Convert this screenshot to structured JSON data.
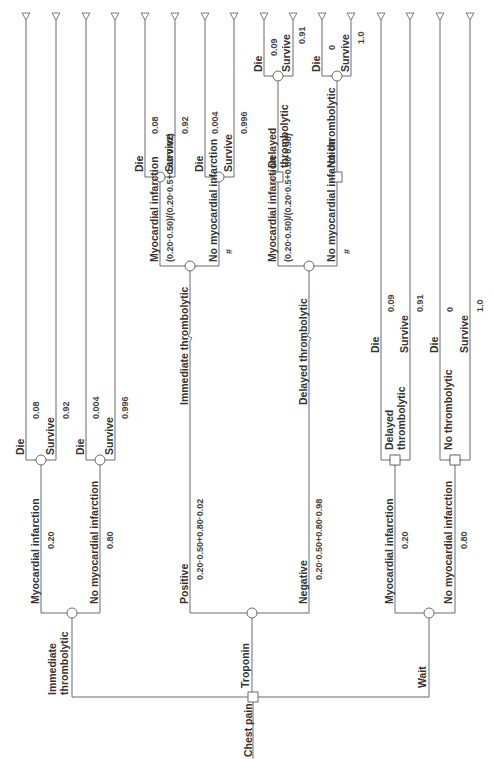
{
  "diagram": {
    "type": "decision-tree",
    "orientation": "rotated-90-ccw",
    "root": {
      "label": "Chest pain",
      "node": "decision"
    },
    "strategies": [
      {
        "id": "immediate",
        "label_line1": "Immediate",
        "label_line2": "thrombolytic",
        "branches": [
          {
            "label": "Myocardial infarction",
            "prob": "0.20",
            "outcomes": [
              {
                "label": "Die",
                "prob": "0.08"
              },
              {
                "label": "Survive",
                "prob": "0.92"
              }
            ]
          },
          {
            "label": "No myocardial infarction",
            "prob": "0.80",
            "outcomes": [
              {
                "label": "Die",
                "prob": "0.004"
              },
              {
                "label": "Survive",
                "prob": "0.996"
              }
            ]
          }
        ]
      },
      {
        "id": "troponin",
        "label": "Troponin",
        "results": [
          {
            "label": "Positive",
            "prob": "0.20·0.50+0.80·0.02",
            "action": "Immediate thrombolytic",
            "branches": [
              {
                "label": "Myocardial infarction",
                "prob": "(0.20·0.50)/(0.20·0.5+0.80·0.02)",
                "outcomes": [
                  {
                    "label": "Die",
                    "prob": "0.08"
                  },
                  {
                    "label": "Survive",
                    "prob": "0.92"
                  }
                ]
              },
              {
                "label": "No myocardial infarction",
                "prob": "#",
                "outcomes": [
                  {
                    "label": "Die",
                    "prob": "0.004"
                  },
                  {
                    "label": "Survive",
                    "prob": "0.996"
                  }
                ]
              }
            ]
          },
          {
            "label": "Negative",
            "prob": "0.20·0.50+0.80·0.98",
            "action": "Delayed thrombolytic",
            "branches": [
              {
                "label": "Myocardial infarction",
                "prob": "(0.20·0.50)/(0.20·0.5+0.80·0.98)",
                "action_line1": "Delayed",
                "action_line2": "thrombolytic",
                "outcomes": [
                  {
                    "label": "Die",
                    "prob": "0.09"
                  },
                  {
                    "label": "Survive",
                    "prob": "0.91"
                  }
                ]
              },
              {
                "label": "No myocardial infarction",
                "prob": "#",
                "action": "No thrombolytic",
                "outcomes": [
                  {
                    "label": "Die",
                    "prob": "0"
                  },
                  {
                    "label": "Survive",
                    "prob": "1.0"
                  }
                ]
              }
            ]
          }
        ]
      },
      {
        "id": "wait",
        "label": "Wait",
        "branches": [
          {
            "label": "Myocardial infarction",
            "prob": "0.20",
            "action_line1": "Delayed",
            "action_line2": "thrombolytic",
            "outcomes": [
              {
                "label": "Die",
                "prob": "0.09"
              },
              {
                "label": "Survive",
                "prob": "0.91"
              }
            ]
          },
          {
            "label": "No myocardial infarction",
            "prob": "0.80",
            "action": "No thrombolytic",
            "outcomes": [
              {
                "label": "Die",
                "prob": "0"
              },
              {
                "label": "Survive",
                "prob": "1.0"
              }
            ]
          }
        ]
      }
    ],
    "colors": {
      "line": "#6b6b6b",
      "text": "#333333",
      "background": "#ffffff"
    }
  }
}
